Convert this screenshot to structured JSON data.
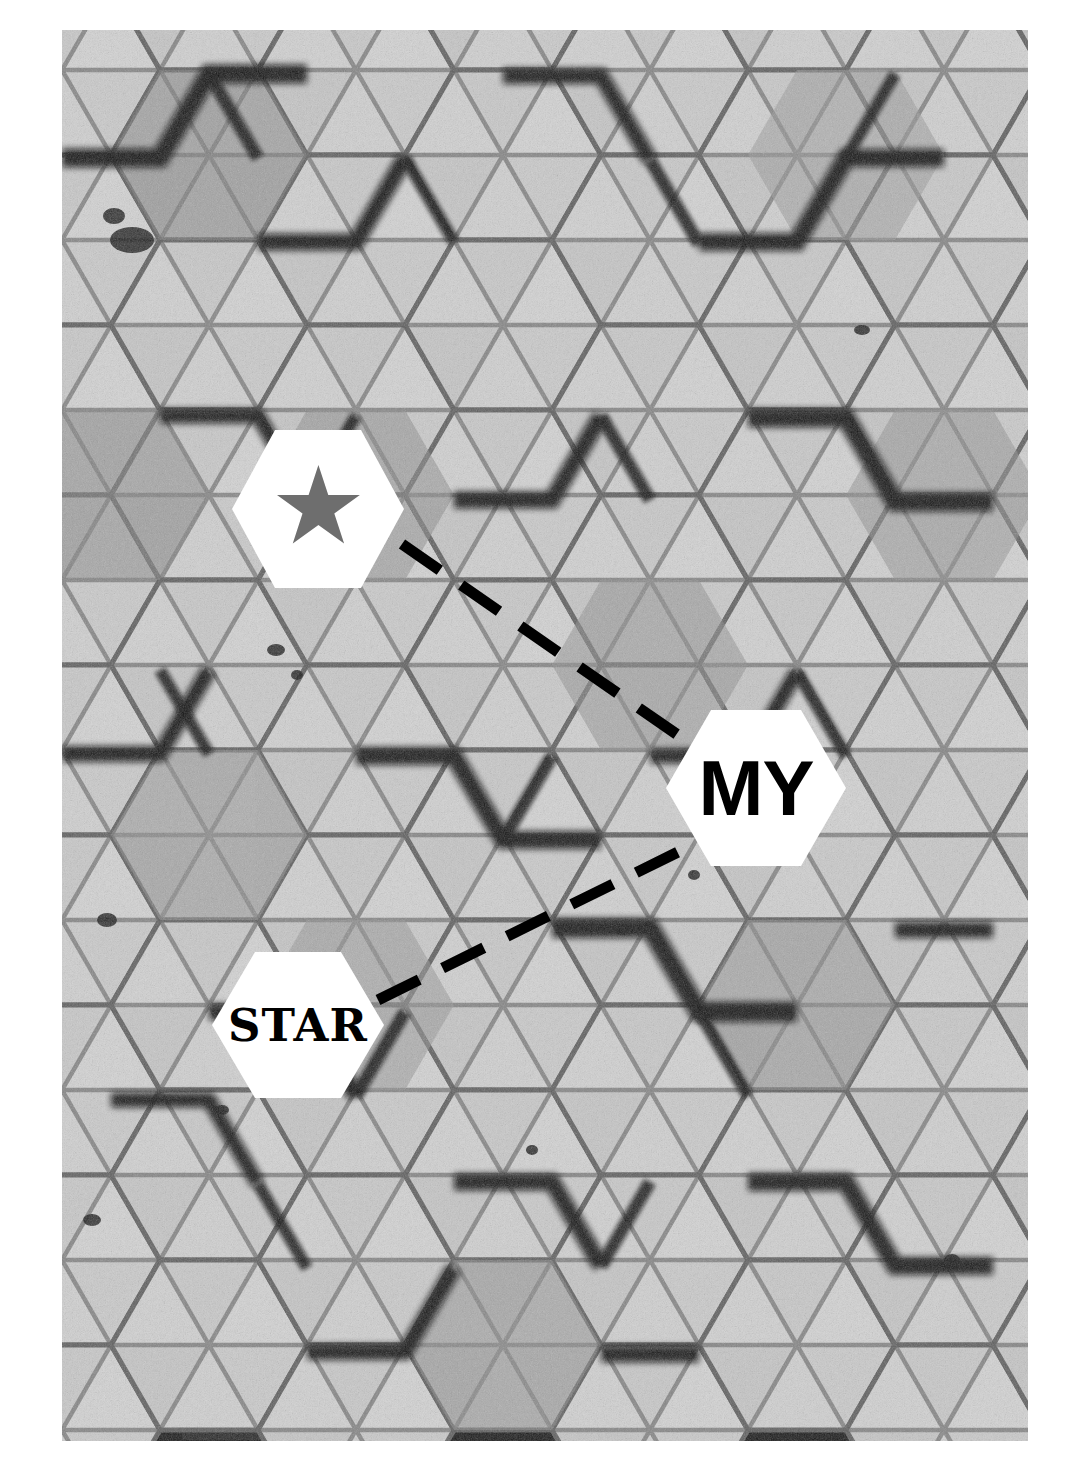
{
  "image": {
    "kind": "grayscale-photograph",
    "subject": "hexagonal-array-cross-section",
    "plate": {
      "x": 62,
      "y": 30,
      "width": 966,
      "height": 1411
    },
    "page_background": "#ffffff",
    "tones": {
      "cell_light": "#d9d9d9",
      "cell_mid": "#a8a8a8",
      "cell_dark": "#6f6f6f",
      "gap_dark": "#1c1c1c",
      "gap_black": "#080808",
      "grain": "#f2f2f2"
    },
    "grid": {
      "orientation": "flat-top-pointy-side",
      "cell_width": 196,
      "cell_height": 170,
      "row_pitch": 150,
      "col_pitch": 147,
      "segments_per_cell": 6,
      "segment_pattern": "six-triangles-from-center"
    }
  },
  "annotations": {
    "accent_color": "#000000",
    "callout_fill": "#ffffff",
    "star_fill": "#6e6e6e",
    "callouts": [
      {
        "id": "star-glyph",
        "label": "★",
        "kind": "star-symbol",
        "shape": "hexagon",
        "x": 232,
        "y": 430,
        "width": 172,
        "height": 158
      },
      {
        "id": "my",
        "label": "MY",
        "kind": "text",
        "shape": "hexagon",
        "x": 666,
        "y": 710,
        "width": 180,
        "height": 156
      },
      {
        "id": "star-word",
        "label": "STAR",
        "kind": "text",
        "shape": "hexagon",
        "x": 212,
        "y": 952,
        "width": 172,
        "height": 146
      }
    ],
    "leader_lines": [
      {
        "id": "star-glyph-to-my",
        "from": "star-glyph",
        "to": "my",
        "x1": 402,
        "y1": 544,
        "x2": 688,
        "y2": 742,
        "stroke": "#000000",
        "stroke_width": 11,
        "dash": "46 26"
      },
      {
        "id": "star-word-to-my",
        "from": "star-word",
        "to": "my",
        "x1": 378,
        "y1": 1000,
        "x2": 678,
        "y2": 852,
        "stroke": "#000000",
        "stroke_width": 11,
        "dash": "46 26"
      }
    ]
  }
}
